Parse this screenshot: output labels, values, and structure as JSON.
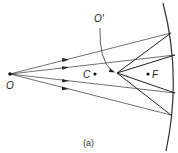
{
  "figure": {
    "caption": "(a)",
    "labels": {
      "object": "O",
      "image": "O'",
      "center": "C",
      "focus": "F"
    },
    "elements": {
      "mirror": "concave-mirror-arc",
      "incident_rays": 4,
      "reflected_rays": 4
    },
    "colors": {
      "line": "#333333",
      "background": "#ffffff"
    }
  }
}
